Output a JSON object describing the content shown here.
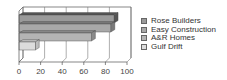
{
  "chart_data": {
    "type": "bar",
    "orientation": "horizontal",
    "style": "3d",
    "title": "",
    "xlabel": "",
    "ylabel": "",
    "categories": [
      "Rose Builders",
      "Easy Construction",
      "A&R Homes",
      "Gulf Drift"
    ],
    "values": [
      88,
      85,
      67,
      15
    ],
    "colors": [
      "#9a9a9a",
      "#a8a8a8",
      "#b4b4b4",
      "#dcdcdc"
    ],
    "top_face_colors": [
      "#555555",
      "#7a7a7a",
      "#8a8a8a",
      "#bdbdbd"
    ],
    "xlim": [
      0,
      100
    ],
    "x_ticks": [
      "0",
      "20",
      "40",
      "60",
      "80",
      "100"
    ],
    "grid": true,
    "legend_position": "right"
  },
  "legend": {
    "items": [
      {
        "label": "Rose Builders",
        "color": "#9a9a9a"
      },
      {
        "label": "Easy Construction",
        "color": "#a8a8a8"
      },
      {
        "label": "A&R Homes",
        "color": "#b4b4b4"
      },
      {
        "label": "Gulf Drift",
        "color": "#dcdcdc"
      }
    ]
  }
}
